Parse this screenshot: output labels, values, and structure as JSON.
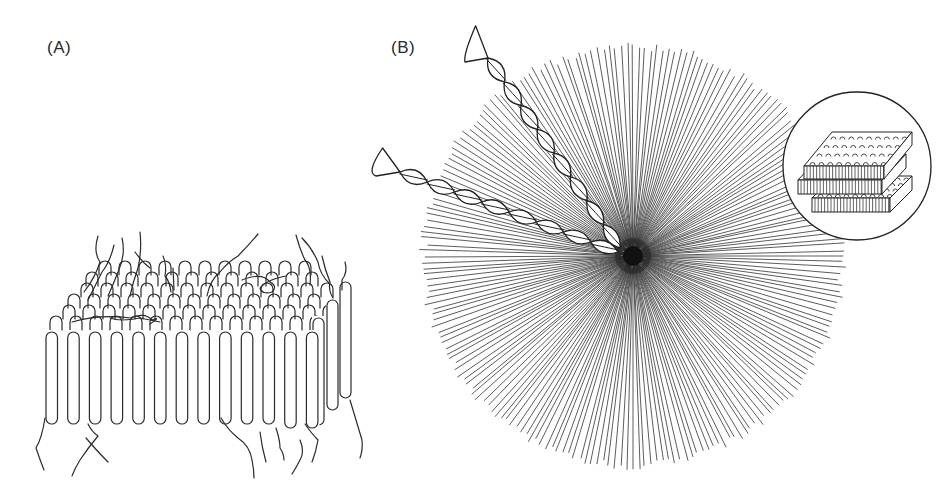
{
  "figure": {
    "panels": [
      {
        "id": "A",
        "label": "(A)",
        "description": "Lamellar layer: rows of hairpin-folded chains with dangling chain ends (cilia) above and below"
      },
      {
        "id": "B",
        "label": "(B)",
        "description": "Spherulite: radial lamellae emanating from a nucleus, with two twisted lamellar ribbons and a magnified inset of stacked lamellae"
      }
    ],
    "panel_a": {
      "front_row_hairpins": 13,
      "back_rows": 6,
      "ink_color": "#2b2b2b"
    },
    "panel_b": {
      "center": [
        633,
        256
      ],
      "radius": 212,
      "ray_count": 220,
      "helix_count": 2,
      "inset": {
        "center": [
          857,
          166
        ],
        "radius": 74,
        "content": "stacked lamellae"
      },
      "ink_color": "#333333"
    }
  }
}
